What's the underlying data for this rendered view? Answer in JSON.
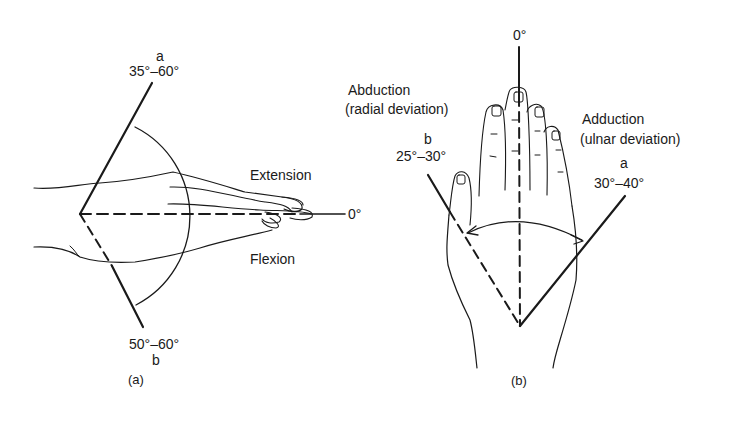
{
  "figure": {
    "panel_a": {
      "caption": "(a)",
      "line_a_letter": "a",
      "line_a_range": "35°–60°",
      "line_b_letter": "b",
      "line_b_range": "50°–60°",
      "extension_label": "Extension",
      "flexion_label": "Flexion",
      "zero_label": "0°"
    },
    "panel_b": {
      "caption": "(b)",
      "zero_label": "0°",
      "abduction_label": "Abduction",
      "abduction_sub": "(radial deviation)",
      "abduction_letter": "b",
      "abduction_range": "25°–30°",
      "adduction_label": "Adduction",
      "adduction_sub": "(ulnar deviation)",
      "adduction_letter": "a",
      "adduction_range": "30°–40°"
    },
    "colors": {
      "ink": "#1a1a1a",
      "background": "#ffffff"
    }
  }
}
